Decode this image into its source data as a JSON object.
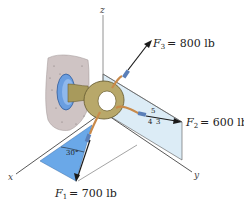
{
  "figure": {
    "axes": {
      "x_label": "x",
      "y_label": "y",
      "z_label": "z"
    },
    "forces": [
      {
        "symbol": "F",
        "subscript": "1",
        "value": "= 700 lb",
        "magnitude": 700,
        "unit": "lb",
        "direction_note": "30° from x-axis in x-y plane region, pointing down"
      },
      {
        "symbol": "F",
        "subscript": "2",
        "value": "= 600 lb",
        "magnitude": 600,
        "unit": "lb",
        "direction_note": "slope triangle 3-4-5"
      },
      {
        "symbol": "F",
        "subscript": "3",
        "value": "= 800 lb",
        "magnitude": 800,
        "unit": "lb",
        "direction_note": "up and outward"
      }
    ],
    "angle_label": "30°",
    "slope_triangle": {
      "hyp": "5",
      "run": "4",
      "rise": "3"
    },
    "colors": {
      "plane_dark": "#6aa8e8",
      "plane_light": "#dcecf6",
      "ring": "#b8a86a",
      "ring_dark": "#7d7040",
      "wall": "#cfc4c4",
      "flange": "#6a9ee0",
      "arrow": "#1a1a1a",
      "cable": "#c98a4a"
    }
  }
}
